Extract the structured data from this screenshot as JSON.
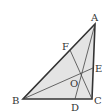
{
  "diagram": {
    "type": "geometry-triangle",
    "fill_color": "#e4e4e4",
    "line_color": "#333333",
    "points": {
      "A": {
        "label": "A",
        "x": 95,
        "y": 24
      },
      "B": {
        "label": "B",
        "x": 23,
        "y": 99
      },
      "C": {
        "label": "C",
        "x": 92,
        "y": 99
      },
      "D": {
        "label": "D",
        "x": 75,
        "y": 99
      },
      "E": {
        "label": "E",
        "x": 93,
        "y": 68
      },
      "F": {
        "label": "F",
        "x": 70,
        "y": 50
      },
      "O": {
        "label": "O",
        "x": 81,
        "y": 74
      }
    },
    "segments": [
      "AB",
      "BC",
      "CA",
      "AD",
      "BE",
      "CF"
    ]
  }
}
